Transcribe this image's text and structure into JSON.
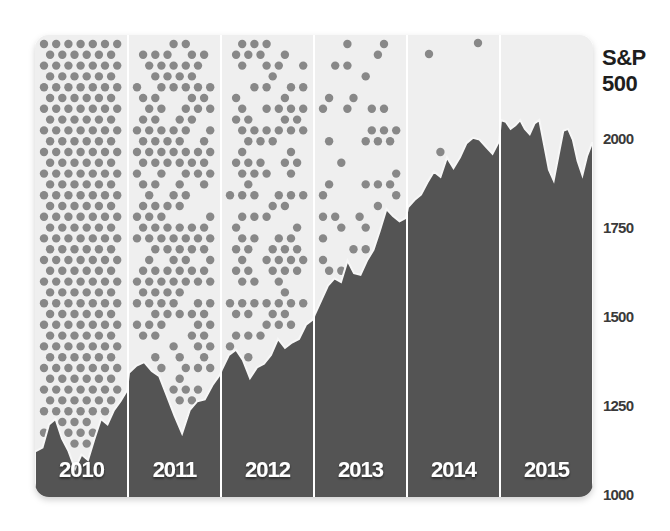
{
  "chart_data": {
    "type": "area",
    "title": "S&P 500",
    "ylabel": "S&P 500",
    "xlabel": "",
    "ylim": [
      1000,
      2200
    ],
    "y_ticks": [
      1000,
      1250,
      1500,
      1750,
      2000
    ],
    "categories": [
      "2010",
      "2011",
      "2012",
      "2013",
      "2014",
      "2015"
    ],
    "grid": false,
    "legend": "none",
    "series": [
      {
        "name": "S&P 500 index",
        "points_by_year": {
          "2010": [
            1115,
            1125,
            1190,
            1205,
            1150,
            1115,
            1065,
            1105,
            1090,
            1150,
            1205,
            1190,
            1230,
            1255,
            1285
          ],
          "2011": [
            1335,
            1355,
            1365,
            1340,
            1325,
            1270,
            1215,
            1165,
            1230,
            1255,
            1260,
            1300,
            1330
          ],
          "2012": [
            1345,
            1385,
            1400,
            1370,
            1320,
            1350,
            1360,
            1385,
            1430,
            1405,
            1420,
            1430,
            1470,
            1485
          ],
          "2013": [
            1500,
            1540,
            1580,
            1600,
            1590,
            1650,
            1615,
            1610,
            1650,
            1680,
            1735,
            1795,
            1775,
            1760,
            1770
          ],
          "2014": [
            1800,
            1820,
            1835,
            1870,
            1900,
            1885,
            1940,
            1910,
            1940,
            1980,
            1995,
            1990,
            1970,
            1950,
            1985
          ],
          "2015": [
            2045,
            2040,
            2020,
            2030,
            2045,
            2020,
            2005,
            2035,
            2045,
            1975,
            1905,
            1875,
            1945,
            2015,
            2020,
            1990,
            1930,
            1890,
            1945,
            1980
          ]
        }
      }
    ],
    "dot_density_by_year": {
      "2010": 1.0,
      "2011": 0.8,
      "2012": 0.6,
      "2013": 0.3,
      "2014": 0.02,
      "2015": 0.0
    }
  },
  "axis": {
    "title_line1": "S&P",
    "title_line2": "500",
    "ticks": [
      {
        "label": "2000",
        "value": 2000
      },
      {
        "label": "1750",
        "value": 1750
      },
      {
        "label": "1500",
        "value": 1500
      },
      {
        "label": "1250",
        "value": 1250
      },
      {
        "label": "1000",
        "value": 1000
      }
    ]
  },
  "panels": [
    {
      "year": "2010"
    },
    {
      "year": "2011"
    },
    {
      "year": "2012"
    },
    {
      "year": "2013"
    },
    {
      "year": "2014"
    },
    {
      "year": "2015"
    }
  ],
  "colors": {
    "panel_bg": "#efefef",
    "area_fill": "#545454",
    "dot": "#888888",
    "divider": "#ffffff",
    "year_label": "#ffffff",
    "axis_text": "#3a3a3a",
    "title_text": "#1e1e1e"
  }
}
